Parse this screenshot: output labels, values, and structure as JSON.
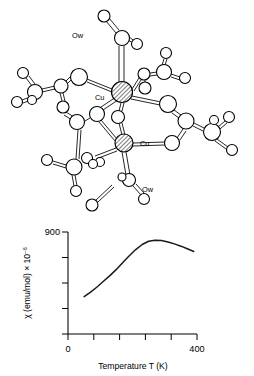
{
  "figure": {
    "title": "",
    "panels": [
      "molecular-structure",
      "susceptibility-plot"
    ]
  },
  "molecule": {
    "name": "copper-acetate-dimer",
    "labels": [
      {
        "id": "ow-top",
        "text": "Ow",
        "x": 72,
        "y": 35
      },
      {
        "id": "cu-top",
        "text": "Cu",
        "x": 95,
        "y": 97
      },
      {
        "id": "cu-bottom",
        "text": "Cu",
        "x": 140,
        "y": 146
      },
      {
        "id": "ow-bottom",
        "text": "Ow",
        "x": 142,
        "y": 189
      }
    ],
    "metal_color": "#d9d9d9",
    "atom_fill": "#ffffff",
    "stroke_color": "#000000",
    "metal_atoms": [
      {
        "id": "Cu1",
        "x": 122,
        "y": 92,
        "r": 10.5
      },
      {
        "id": "Cu2",
        "x": 124,
        "y": 143,
        "r": 9.0
      }
    ],
    "atoms": [
      {
        "id": "O1",
        "x": 104,
        "y": 16,
        "r": 6.0
      },
      {
        "id": "C1",
        "x": 122,
        "y": 38,
        "r": 7.5
      },
      {
        "id": "O2",
        "x": 137,
        "y": 44,
        "r": 5.5
      },
      {
        "id": "O3",
        "x": 79,
        "y": 77,
        "r": 8.5
      },
      {
        "id": "C2",
        "x": 61,
        "y": 86,
        "r": 7.0
      },
      {
        "id": "C3",
        "x": 35,
        "y": 92,
        "r": 7.5
      },
      {
        "id": "O4",
        "x": 23,
        "y": 73,
        "r": 5.5
      },
      {
        "id": "O5",
        "x": 17,
        "y": 102,
        "r": 5.5
      },
      {
        "id": "O6",
        "x": 32,
        "y": 100,
        "r": 4.5
      },
      {
        "id": "O7",
        "x": 63,
        "y": 107,
        "r": 6.0
      },
      {
        "id": "O8",
        "x": 77,
        "y": 122,
        "r": 7.5
      },
      {
        "id": "O9",
        "x": 97,
        "y": 114,
        "r": 7.5
      },
      {
        "id": "O10",
        "x": 118,
        "y": 117,
        "r": 6.5
      },
      {
        "id": "C4",
        "x": 144,
        "y": 74,
        "r": 6.0
      },
      {
        "id": "O11",
        "x": 145,
        "y": 88,
        "r": 6.0
      },
      {
        "id": "C5",
        "x": 164,
        "y": 72,
        "r": 7.5
      },
      {
        "id": "O12",
        "x": 166,
        "y": 53,
        "r": 5.5
      },
      {
        "id": "O13",
        "x": 185,
        "y": 78,
        "r": 5.5
      },
      {
        "id": "O14",
        "x": 168,
        "y": 104,
        "r": 8.5
      },
      {
        "id": "C6",
        "x": 186,
        "y": 121,
        "r": 8.0
      },
      {
        "id": "C7",
        "x": 212,
        "y": 132,
        "r": 8.5
      },
      {
        "id": "O15",
        "x": 229,
        "y": 117,
        "r": 5.5
      },
      {
        "id": "O16",
        "x": 232,
        "y": 150,
        "r": 5.5
      },
      {
        "id": "O17",
        "x": 214,
        "y": 120,
        "r": 4.5
      },
      {
        "id": "O18",
        "x": 172,
        "y": 143,
        "r": 7.5
      },
      {
        "id": "C8",
        "x": 100,
        "y": 162,
        "r": 4.5
      },
      {
        "id": "C9",
        "x": 87,
        "y": 158,
        "r": 5.5
      },
      {
        "id": "C10",
        "x": 74,
        "y": 167,
        "r": 8.0
      },
      {
        "id": "O19",
        "x": 47,
        "y": 160,
        "r": 5.5
      },
      {
        "id": "O20",
        "x": 76,
        "y": 191,
        "r": 5.5
      },
      {
        "id": "C11",
        "x": 93,
        "y": 164,
        "r": 4.5
      },
      {
        "id": "C12",
        "x": 129,
        "y": 180,
        "r": 6.5
      },
      {
        "id": "O21",
        "x": 122,
        "y": 177,
        "r": 4.0
      },
      {
        "id": "O22",
        "x": 144,
        "y": 199,
        "r": 5.5
      }
    ]
  },
  "chart_data": {
    "type": "line",
    "title": "",
    "xlabel": "Temperature T (K)",
    "ylabel": "χ (emu/mol) × 10",
    "ylabel_exponent": "–6",
    "xlim": [
      0,
      400
    ],
    "ylim": [
      0,
      900
    ],
    "xticks": [
      0,
      80,
      160,
      240,
      320,
      400
    ],
    "xtick_labels": [
      "0",
      "",
      "",
      "",
      "",
      "400"
    ],
    "yticks": [
      0,
      225,
      450,
      675,
      900
    ],
    "ytick_labels": [
      "0",
      "",
      "",
      "",
      "900"
    ],
    "grid": false,
    "legend": null,
    "series": [
      {
        "name": "magnetic susceptibility",
        "x": [
          50,
          70,
          90,
          110,
          130,
          150,
          170,
          190,
          210,
          230,
          250,
          270,
          290,
          310,
          330,
          350,
          370,
          390
        ],
        "y": [
          330,
          370,
          415,
          465,
          515,
          570,
          630,
          690,
          745,
          790,
          818,
          828,
          825,
          812,
          795,
          775,
          752,
          728
        ]
      }
    ]
  }
}
